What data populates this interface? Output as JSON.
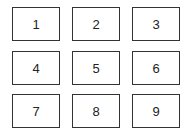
{
  "grid": {
    "rows": 3,
    "columns": 3,
    "border_color": "#333333",
    "cells": [
      {
        "label": "1"
      },
      {
        "label": "2"
      },
      {
        "label": "3"
      },
      {
        "label": "4"
      },
      {
        "label": "5"
      },
      {
        "label": "6"
      },
      {
        "label": "7"
      },
      {
        "label": "8"
      },
      {
        "label": "9"
      }
    ]
  }
}
